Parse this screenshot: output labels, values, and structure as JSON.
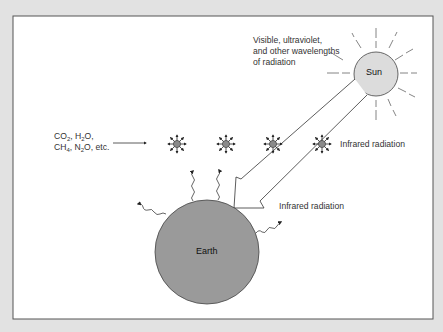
{
  "diagram": {
    "sun": {
      "label": "Sun",
      "fill": "#dcdcdc"
    },
    "earth": {
      "label": "Earth",
      "fill": "#999999"
    },
    "incoming_label": {
      "line1": "Visible, ultraviolet,",
      "line2": "and other wavelengths",
      "line3": "of radiation"
    },
    "gases_label": {
      "line1_parts": [
        "CO",
        "2",
        ", H",
        "2",
        "O,"
      ],
      "line2_parts": [
        "CH",
        "4",
        ", N",
        "2",
        "O, etc."
      ]
    },
    "infrared_label_upper": "Infrared radiation",
    "infrared_label_lower": "Infrared radiation",
    "molecule_count": 4,
    "colors": {
      "background": "#e2e2e2",
      "panel": "#ffffff",
      "molecule": "#8a8a8a",
      "stroke": "#333333"
    }
  }
}
